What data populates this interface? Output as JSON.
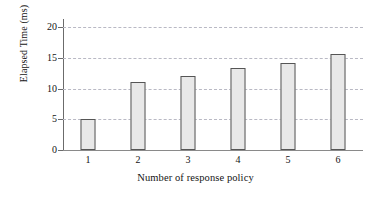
{
  "chart_data": {
    "type": "bar",
    "title": "",
    "subtitle": "",
    "categories": [
      "1",
      "2",
      "3",
      "4",
      "5",
      "6"
    ],
    "values": [
      5,
      11,
      12,
      13.3,
      14.2,
      15.7
    ],
    "series": [
      {
        "name": "Elapsed Time",
        "values": [
          5,
          11,
          12,
          13.3,
          14.2,
          15.7
        ]
      }
    ],
    "xlabel": "Number of response policy",
    "ylabel": "Elapsed Time (ms)",
    "ylim": [
      0,
      21
    ],
    "xlim": [
      0.5,
      6.5
    ],
    "yticks": [
      0,
      5,
      10,
      15,
      20
    ],
    "ytick_labels": [
      "0",
      "5",
      "10",
      "15",
      "20"
    ],
    "xtick_labels": [
      "1",
      "2",
      "3",
      "4",
      "5",
      "6"
    ],
    "grid": "horizontal-dashed",
    "legend": "none",
    "annotations": [],
    "colors": {
      "bar_fill": "#e8e8e8",
      "bar_border": "#555555",
      "gridline": "#b9b9c4",
      "axis": "#6b6b6b",
      "text": "#141414",
      "background": "#ffffff"
    }
  }
}
